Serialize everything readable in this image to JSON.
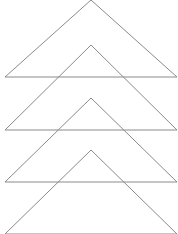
{
  "diagram": {
    "stroke_color": "#8a8a8a",
    "background": "#ffffff",
    "triangles": [
      {
        "apex": [
          91,
          0
        ],
        "base_left": [
          5,
          77
        ],
        "base_right": [
          177,
          77
        ]
      },
      {
        "apex": [
          91,
          45
        ],
        "base_left": [
          5,
          130
        ],
        "base_right": [
          177,
          130
        ]
      },
      {
        "apex": [
          91,
          98
        ],
        "base_left": [
          5,
          182
        ],
        "base_right": [
          177,
          182
        ]
      },
      {
        "apex": [
          91,
          150
        ],
        "base_left": [
          5,
          234
        ],
        "base_right": [
          177,
          234
        ]
      }
    ]
  }
}
